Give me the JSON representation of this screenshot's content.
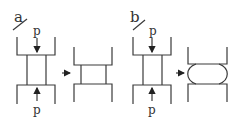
{
  "diagram": {
    "panels": [
      {
        "label": "a",
        "force_top": "p",
        "force_bottom": "p",
        "result": "barrel-free (flat sides)"
      },
      {
        "label": "b",
        "force_top": "p",
        "force_bottom": "p",
        "result": "barreled (bulged sides)"
      }
    ],
    "colors": {
      "line": "#3a3a3a",
      "background": "#ffffff"
    }
  }
}
